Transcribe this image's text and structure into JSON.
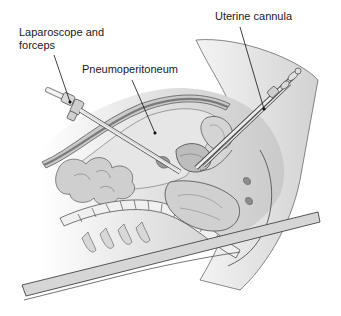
{
  "figure": {
    "labels": {
      "laparoscope": {
        "line1": "Laparoscope and",
        "line2": "forceps"
      },
      "pneumoperitoneum": "Pneumoperitoneum",
      "uterine_cannula": "Uterine cannula"
    },
    "colors": {
      "background": "#ffffff",
      "outline": "#4a4a4a",
      "skin_fill": "#dcdcdc",
      "skin_shadow": "#b8b8b8",
      "abdominal_wall": "#8a8a8a",
      "cavity_fill": "#e4e4e4",
      "organ_fill": "#c8c8c8",
      "organ_dark": "#9a9a9a",
      "instrument_fill": "#e8e8e8",
      "table_fill": "#d4d4d4",
      "leader_line": "#111111"
    }
  }
}
